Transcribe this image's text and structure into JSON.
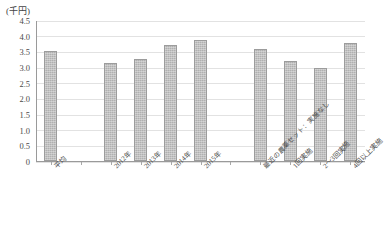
{
  "chart_data": {
    "type": "bar",
    "title": "",
    "subtitle": "",
    "xlabel": "",
    "ylabel": "",
    "unit_label": "(千円)",
    "ylim": [
      0,
      4.5
    ],
    "ytick_step": 0.5,
    "grid": true,
    "legend": "none",
    "orientation": "vertical",
    "bar_color": "#b0b0b0",
    "bar_border_color": "#9c9c9c",
    "categories": [
      "平均",
      "2012年",
      "2013年",
      "2014年",
      "2015年",
      "最近の農薬セット：実施なし",
      "1回実施",
      "2～3回実施",
      "4回以上実施"
    ],
    "values": [
      3.5,
      3.13,
      3.27,
      3.7,
      3.87,
      3.57,
      3.19,
      2.96,
      3.77
    ],
    "ytick_labels": [
      "0",
      "0.5",
      "1.0",
      "1.5",
      "2.0",
      "2.5",
      "3.0",
      "3.5",
      "4.0",
      "4.5"
    ],
    "ytick_values": [
      0,
      0.5,
      1.0,
      1.5,
      2.0,
      2.5,
      3.0,
      3.5,
      4.0,
      4.5
    ],
    "group_gaps_after": [
      0,
      4
    ],
    "slot_count": 11
  }
}
